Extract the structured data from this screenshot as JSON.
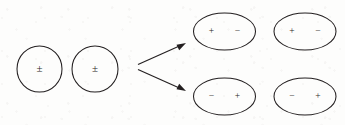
{
  "figure": {
    "background_color": "#fdfdfc",
    "ink_color": "#231f20",
    "text_color": "#2a2724"
  },
  "source_group": {
    "name": "neutral-particles",
    "shape": "circle",
    "items": [
      {
        "id": "source-circle-1",
        "label": "±",
        "cx": 39.5,
        "cy": 69,
        "rx": 22.5,
        "ry": 23
      },
      {
        "id": "source-circle-2",
        "label": "±",
        "cx": 95,
        "cy": 69,
        "rx": 23,
        "ry": 23
      }
    ]
  },
  "arrows": [
    {
      "id": "arrow-upper",
      "direction": "up-right",
      "x1": 138,
      "y1": 64,
      "x2": 186,
      "y2": 43
    },
    {
      "id": "arrow-lower",
      "direction": "down-right",
      "x1": 138,
      "y1": 70,
      "x2": 186,
      "y2": 91
    }
  ],
  "result_group": {
    "name": "polarized-dipoles",
    "shape": "ellipse",
    "rows": [
      {
        "id": "row-upper",
        "orientation": "plus-minus",
        "left_charge": "+",
        "right_charge": "−",
        "cy": 31.5,
        "items": [
          {
            "id": "dipole-top-left",
            "cx": 224.5,
            "rx": 31,
            "ry": 18.5
          },
          {
            "id": "dipole-top-right",
            "cx": 305,
            "rx": 31,
            "ry": 18.5
          }
        ]
      },
      {
        "id": "row-lower",
        "orientation": "minus-plus",
        "left_charge": "−",
        "right_charge": "+",
        "cy": 96.5,
        "items": [
          {
            "id": "dipole-bottom-left",
            "cx": 224.5,
            "rx": 31,
            "ry": 18.5
          },
          {
            "id": "dipole-bottom-right",
            "cx": 305,
            "rx": 31,
            "ry": 18.5
          }
        ]
      }
    ],
    "charge_offset_x": 13
  }
}
